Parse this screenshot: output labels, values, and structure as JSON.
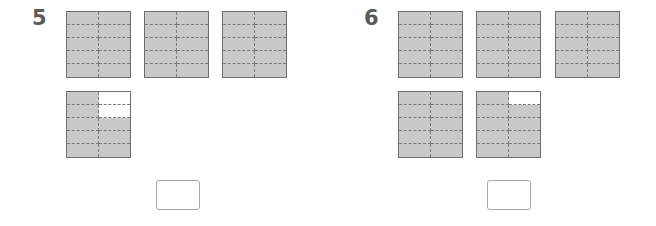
{
  "problems": [
    {
      "number": "5",
      "grid": {
        "columns": 2,
        "rows": 5,
        "cells_per_square": 10
      },
      "squares": [
        {
          "shaded_cells": 10,
          "unshaded": []
        },
        {
          "shaded_cells": 10,
          "unshaded": []
        },
        {
          "shaded_cells": 10,
          "unshaded": []
        },
        {
          "shaded_cells": 8,
          "unshaded": [
            [
              0,
              1
            ],
            [
              1,
              1
            ]
          ]
        }
      ],
      "answer": ""
    },
    {
      "number": "6",
      "grid": {
        "columns": 2,
        "rows": 5,
        "cells_per_square": 10
      },
      "squares": [
        {
          "shaded_cells": 10,
          "unshaded": []
        },
        {
          "shaded_cells": 10,
          "unshaded": []
        },
        {
          "shaded_cells": 10,
          "unshaded": []
        },
        {
          "shaded_cells": 10,
          "unshaded": []
        },
        {
          "shaded_cells": 9,
          "unshaded": [
            [
              0,
              1
            ]
          ]
        }
      ],
      "answer": ""
    }
  ],
  "colors": {
    "shaded": "#c9c9c9",
    "unshaded": "#ffffff",
    "border": "#6e6e6e",
    "dashed_line": "#7a7a7a",
    "number_text": "#5a5a5a",
    "answer_border": "#a8a8a8"
  }
}
